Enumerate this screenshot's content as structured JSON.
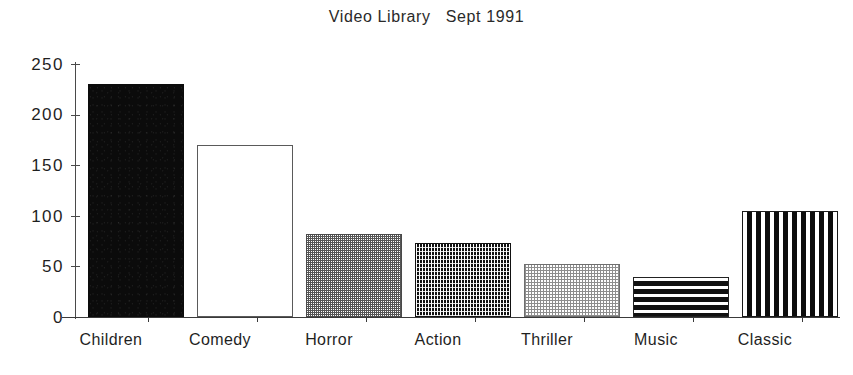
{
  "chart_data": {
    "type": "bar",
    "title": "Video Library   Sept 1991",
    "xlabel": "",
    "ylabel": "",
    "categories": [
      "Children",
      "Comedy",
      "Horror",
      "Action",
      "Thriller",
      "Music",
      "Classic"
    ],
    "values": [
      230,
      170,
      82,
      73,
      52,
      40,
      105
    ],
    "ylim": [
      0,
      250
    ],
    "yticks": [
      0,
      50,
      100,
      150,
      200,
      250
    ],
    "ytick_labels": [
      "0",
      "50",
      "100",
      "150",
      "200",
      "250"
    ],
    "grid": false,
    "legend": "none",
    "bar_fills": [
      "solid-black",
      "open-white-outline",
      "medium-gray-checker",
      "dark-dense-checker",
      "light-gray-dots",
      "horizontal-black-stripes",
      "vertical-black-stripes"
    ],
    "series": [
      {
        "name": "Video Library Sept 1991",
        "values": [
          230,
          170,
          82,
          73,
          52,
          40,
          105
        ]
      }
    ],
    "annotations": []
  },
  "axis": {
    "y_tick_0": "0",
    "y_tick_50": "50",
    "y_tick_100": "100",
    "y_tick_150": "150",
    "y_tick_200": "200",
    "y_tick_250": "250"
  },
  "colors": {
    "background": "#ffffff",
    "ink": "#1a1a1a",
    "axis": "#3a3a3a",
    "bar_dark": "#0b0b0b",
    "bar_mid": "#555555",
    "bar_light": "#8e8e8e"
  }
}
